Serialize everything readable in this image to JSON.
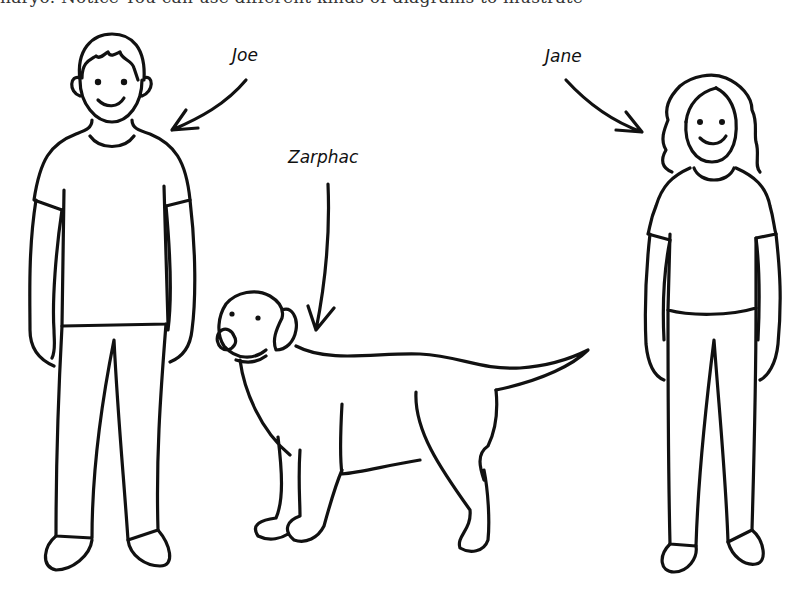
{
  "caption": {
    "text": "naryo. Notice You can use different kinds of diagrams to illustrate"
  },
  "labels": {
    "joe": "Joe",
    "jane": "Jane",
    "zarphac": "Zarphac"
  },
  "figures": [
    {
      "name": "Joe",
      "kind": "person"
    },
    {
      "name": "Zarphac",
      "kind": "dog"
    },
    {
      "name": "Jane",
      "kind": "person"
    }
  ],
  "colors": {
    "ink": "#111111",
    "background": "#ffffff"
  }
}
